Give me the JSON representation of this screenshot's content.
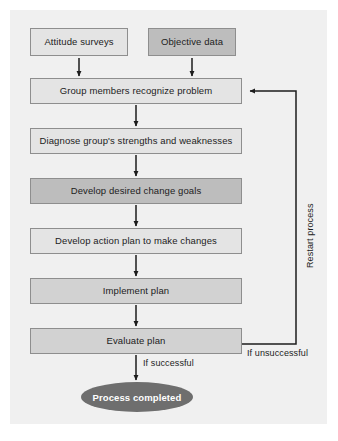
{
  "figure": {
    "type": "flowchart",
    "background_color": "#ffffff",
    "panel_color": "#f0f0f0"
  },
  "palette": {
    "box_light": "#e4e4e4",
    "box_mid": "#d2d2d2",
    "box_dark": "#bdbdbd",
    "box_border": "#8e8e8e",
    "terminator_fill": "#6e6e6e",
    "terminator_text": "#ffffff",
    "line_color": "#1c1c1c",
    "text_color": "#1c1c1c"
  },
  "nodes": {
    "input_left": {
      "label": "Attitude surveys",
      "shape": "rectangle",
      "shade": "light"
    },
    "input_right": {
      "label": "Objective data",
      "shape": "rectangle",
      "shade": "dark"
    },
    "step1": {
      "label": "Group members recognize problem",
      "shape": "rectangle",
      "shade": "light"
    },
    "step2": {
      "label": "Diagnose group's strengths and weaknesses",
      "shape": "rectangle",
      "shade": "light"
    },
    "step3": {
      "label": "Develop desired change goals",
      "shape": "rectangle",
      "shade": "dark"
    },
    "step4": {
      "label": "Develop action plan to make changes",
      "shape": "rectangle",
      "shade": "light"
    },
    "step5": {
      "label": "Implement plan",
      "shape": "rectangle",
      "shade": "mid"
    },
    "step6": {
      "label": "Evaluate plan",
      "shape": "rectangle",
      "shade": "mid"
    },
    "end": {
      "label": "Process completed",
      "shape": "ellipse",
      "shade": "dark"
    }
  },
  "edge_labels": {
    "restart": "Restart process",
    "unsuccessful": "If unsuccessful",
    "successful": "If successful"
  }
}
